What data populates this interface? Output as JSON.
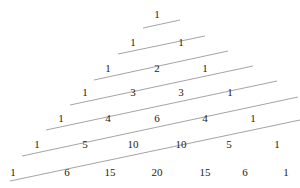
{
  "figure": {
    "width": 300,
    "height": 188,
    "background_color": "#ffffff",
    "number_color": "#222222",
    "line_color": "#9a9a9a"
  },
  "chart_data": {
    "type": "diagram",
    "rows": [
      {
        "index": 0,
        "values": [
          1
        ],
        "y": 14,
        "xs": [
          157
        ]
      },
      {
        "index": 1,
        "values": [
          1,
          1
        ],
        "y": 42,
        "xs": [
          133,
          181
        ]
      },
      {
        "index": 2,
        "values": [
          1,
          2,
          1
        ],
        "y": 68,
        "xs": [
          108,
          157,
          205
        ]
      },
      {
        "index": 3,
        "values": [
          1,
          3,
          3,
          1
        ],
        "y": 92,
        "xs": [
          85,
          133,
          181,
          230
        ]
      },
      {
        "index": 4,
        "values": [
          1,
          4,
          6,
          4,
          1
        ],
        "y": 118,
        "xs": [
          61,
          108,
          157,
          205,
          253
        ]
      },
      {
        "index": 5,
        "values": [
          1,
          5,
          10,
          10,
          5,
          1
        ],
        "y": 144,
        "xs": [
          37,
          85,
          133,
          181,
          229,
          277
        ]
      },
      {
        "index": 6,
        "values": [
          1,
          6,
          15,
          20,
          15,
          6,
          1
        ],
        "y": 172,
        "xs": [
          13,
          67,
          110,
          157,
          205,
          245,
          286
        ]
      }
    ],
    "diagonal_lines": [
      {
        "id": "diagonal-1",
        "x1": 143,
        "y1": 28,
        "x2": 180,
        "y2": 20
      },
      {
        "id": "diagonal-2",
        "x1": 118,
        "y1": 54,
        "x2": 205,
        "y2": 36
      },
      {
        "id": "diagonal-3",
        "x1": 94,
        "y1": 80,
        "x2": 228,
        "y2": 51
      },
      {
        "id": "diagonal-4",
        "x1": 70,
        "y1": 105,
        "x2": 253,
        "y2": 66
      },
      {
        "id": "diagonal-5",
        "x1": 46,
        "y1": 130,
        "x2": 277,
        "y2": 81
      },
      {
        "id": "diagonal-6",
        "x1": 22,
        "y1": 156,
        "x2": 298,
        "y2": 97
      },
      {
        "id": "diagonal-7",
        "x1": 10,
        "y1": 181,
        "x2": 300,
        "y2": 120
      }
    ],
    "line_count": 7,
    "row_count": 7,
    "xlabel": "",
    "ylabel": "",
    "grid": false,
    "legend": false
  }
}
